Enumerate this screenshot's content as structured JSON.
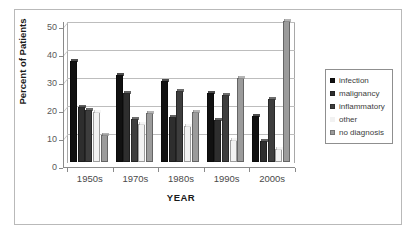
{
  "chart_data": {
    "type": "bar",
    "title": "",
    "xlabel": "YEAR",
    "ylabel": "Percent of Patients",
    "categories": [
      "1950s",
      "1970s",
      "1980s",
      "1990s",
      "2000s"
    ],
    "ylim": [
      0,
      50
    ],
    "yticks": [
      0,
      10,
      20,
      30,
      40,
      50
    ],
    "grid": true,
    "legend_position": "right",
    "series": [
      {
        "name": "infection",
        "color": "#111111",
        "values": [
          36,
          31,
          29,
          24.5,
          16.5
        ]
      },
      {
        "name": "malignancy",
        "color": "#2e2e2e",
        "values": [
          19.5,
          24.5,
          16,
          15,
          7.5
        ]
      },
      {
        "name": "inflammatory",
        "color": "#3d3d3d",
        "values": [
          18.5,
          15.5,
          25.5,
          24,
          22.5
        ]
      },
      {
        "name": "other",
        "color": "#f2f2f2",
        "values": [
          18,
          13.5,
          13,
          8,
          4.5
        ]
      },
      {
        "name": "no diagnosis",
        "color": "#9b9b9b",
        "values": [
          9.5,
          17.5,
          18,
          30,
          50.5
        ]
      }
    ]
  },
  "axis": {
    "y_tick_labels": [
      "50",
      "40",
      "30",
      "20",
      "10",
      "0"
    ],
    "y_title": "Percent of Patients",
    "x_tick_labels": [
      "1950s",
      "1970s",
      "1980s",
      "1990s",
      "2000s"
    ],
    "x_title": "YEAR"
  },
  "legend": {
    "items": [
      {
        "label": "infection"
      },
      {
        "label": "malignancy"
      },
      {
        "label": "inflammatory"
      },
      {
        "label": "other"
      },
      {
        "label": "no diagnosis"
      }
    ]
  }
}
